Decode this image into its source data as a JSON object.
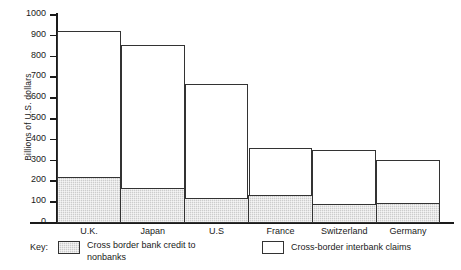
{
  "chart_data": {
    "type": "bar",
    "subtype": "stacked",
    "title": "",
    "xlabel": "",
    "ylabel": "Billions of U.S. dollars",
    "ylim": [
      0,
      1000
    ],
    "yticks": [
      0,
      100,
      200,
      300,
      400,
      500,
      600,
      700,
      800,
      900,
      1000
    ],
    "ytick_labels": [
      "0",
      "100",
      "200",
      "300",
      "400",
      "500",
      "600",
      "700",
      "800",
      "900",
      "1000"
    ],
    "grid": false,
    "legend_position": "bottom",
    "categories": [
      "U.K.",
      "Japan",
      "U.S",
      "France",
      "Switzerland",
      "Germany"
    ],
    "series": [
      {
        "name": "Cross border bank credit to nonbanks",
        "swatch": "shaded",
        "color": "#cccccc",
        "values": [
          220,
          165,
          120,
          130,
          88,
          95
        ]
      },
      {
        "name": "Cross-border interbank claims",
        "swatch": "open",
        "color": "#ffffff",
        "values": [
          700,
          685,
          545,
          225,
          257,
          202
        ]
      }
    ],
    "totals": [
      920,
      850,
      665,
      355,
      345,
      297
    ]
  },
  "axis": {
    "y_title": "Billions of U.S. dollars"
  },
  "legend": {
    "key_label": "Key:",
    "shaded_label": "Cross border bank credit to nonbanks",
    "open_label": "Cross-border interbank claims"
  },
  "colors": {
    "shaded_fill": "#cccccc",
    "open_fill": "#ffffff",
    "stroke": "#333333",
    "axis": "#1a1a1a",
    "background": "#ffffff"
  }
}
